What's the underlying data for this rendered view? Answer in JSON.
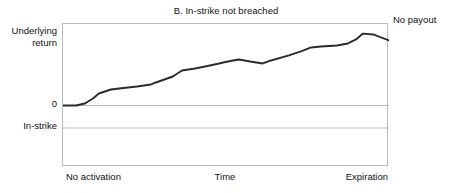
{
  "chart_data": {
    "type": "line",
    "title": "B. In-strike not breached",
    "subtitle": "",
    "xlabel": "Time",
    "ylabel": "Underlying return",
    "grid": true,
    "legend_position": "none",
    "xlim": [
      0,
      100
    ],
    "ylim": [
      -43,
      57
    ],
    "x_tick_labels": [
      "No activation",
      "Time",
      "Expiration"
    ],
    "y_tick_labels": [
      "Underlying return",
      "0",
      "In-strike"
    ],
    "y_reference_lines": [
      {
        "name": "zero-line",
        "label": "0",
        "value": 0
      },
      {
        "name": "in-strike-line",
        "label": "In-strike",
        "value": -16
      }
    ],
    "annotations": [
      {
        "name": "no-payout-annotation",
        "text": "No payout",
        "x": 100,
        "y": 57
      }
    ],
    "series": [
      {
        "name": "underlying-return-path",
        "color": "#2b2b2b",
        "x": [
          0.0,
          4.0,
          6.7,
          9.2,
          11.0,
          14.7,
          17.2,
          22.7,
          27.0,
          28.5,
          33.7,
          36.5,
          40.5,
          43.6,
          47.9,
          49.1,
          52.1,
          54.0,
          57.4,
          61.3,
          63.8,
          69.3,
          73.0,
          76.1,
          79.1,
          84.0,
          87.4,
          89.9,
          92.0,
          95.1,
          100.0
        ],
        "y": [
          0.0,
          0.0,
          1.4,
          4.9,
          8.4,
          11.2,
          11.9,
          13.3,
          14.7,
          16.1,
          20.3,
          24.5,
          25.9,
          27.3,
          29.4,
          30.1,
          31.5,
          32.2,
          30.8,
          29.4,
          31.5,
          35.0,
          37.8,
          40.6,
          41.3,
          42.0,
          43.4,
          46.2,
          50.3,
          49.7,
          45.5
        ]
      }
    ]
  },
  "chart": {
    "title": "B. In-strike not breached",
    "y_axis": {
      "top_label_line1": "Underlying",
      "top_label_line2": "return",
      "zero_label": "0",
      "instrike_label": "In-strike"
    },
    "x_axis": {
      "start_label": "No activation",
      "center_label": "Time",
      "end_label": "Expiration"
    },
    "annotation": {
      "no_payout": "No payout"
    },
    "colors": {
      "line": "#2b2b2b",
      "gridline": "#b9b9b9",
      "frame": "#b9b9b9",
      "text": "#111111",
      "background": "#ffffff"
    }
  }
}
